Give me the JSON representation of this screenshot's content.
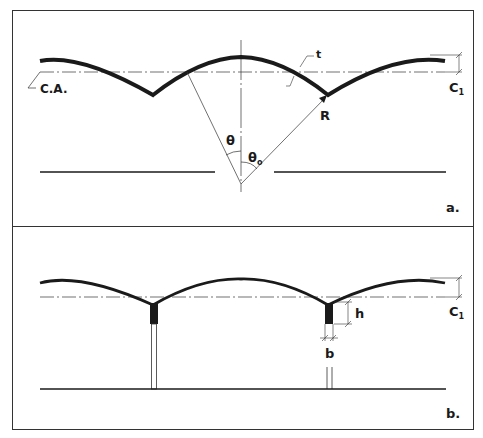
{
  "figure": {
    "panel_a": {
      "label": "a.",
      "axis_label": "C.A.",
      "rise_label": "C",
      "rise_sub": "1",
      "thickness_label": "t",
      "radius_label": "R",
      "theta_label": "θ",
      "theta0_label": "θ",
      "theta0_sub": "o"
    },
    "panel_b": {
      "label": "b.",
      "rise_label": "C",
      "rise_sub": "1",
      "height_label": "h",
      "width_label": "b"
    },
    "colors": {
      "ink": "#1a1a1a",
      "background": "#ffffff",
      "frame": "#333333"
    }
  }
}
